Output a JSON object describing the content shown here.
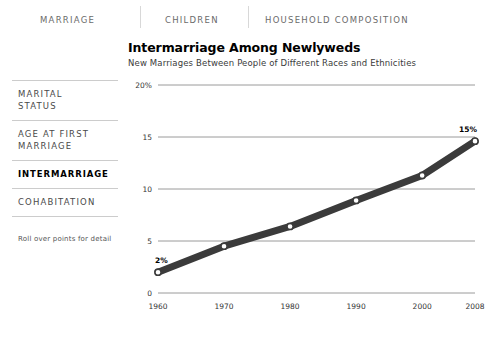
{
  "nav": {
    "items": [
      {
        "label": "MARRIAGE"
      },
      {
        "label": "CHILDREN"
      },
      {
        "label": "HOUSEHOLD COMPOSITION"
      }
    ]
  },
  "sidebar": {
    "items": [
      {
        "label": "MARITAL\nSTATUS",
        "active": false
      },
      {
        "label": "AGE AT FIRST\nMARRIAGE",
        "active": false
      },
      {
        "label": "INTERMARRIAGE",
        "active": true
      },
      {
        "label": "COHABITATION",
        "active": false
      }
    ],
    "hint": "Roll over points for detail"
  },
  "chart": {
    "title": "Intermarriage Among Newlyweds",
    "subtitle": "New Marriages Between People of Different Races and Ethnicities"
  },
  "chart_data": {
    "type": "line",
    "title": "Intermarriage Among Newlyweds",
    "subtitle": "New Marriages Between People of Different Races and Ethnicities",
    "xlabel": "",
    "ylabel": "",
    "x": [
      1960,
      1970,
      1980,
      1990,
      2000,
      2008
    ],
    "values": [
      2,
      4.5,
      6.4,
      8.9,
      11.3,
      14.6
    ],
    "categories": [
      "1960",
      "1970",
      "1980",
      "1990",
      "2000",
      "2008"
    ],
    "xticklabels": [
      "1960",
      "1970",
      "1980",
      "1990",
      "2000",
      "2008"
    ],
    "yticks": [
      0,
      5,
      10,
      15,
      20
    ],
    "yticklabels": [
      "0",
      "5",
      "10",
      "15",
      "20%"
    ],
    "ylim": [
      0,
      20
    ],
    "xlim": [
      1960,
      2008
    ],
    "grid": true,
    "legend": false,
    "annotations": [
      {
        "text": "2%",
        "x": 1960,
        "y": 2
      },
      {
        "text": "15%",
        "x": 2008,
        "y": 14.6
      }
    ],
    "line_color": "#3b3b3b",
    "marker_fill": "#ffffff"
  }
}
